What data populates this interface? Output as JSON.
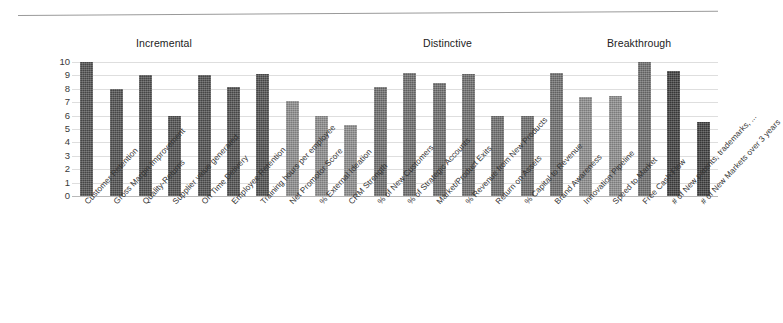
{
  "figure": {
    "top_rule": "horizontal-divider-rule"
  },
  "sections": [
    {
      "label": "Incremental"
    },
    {
      "label": "Distinctive"
    },
    {
      "label": "Breakthrough"
    }
  ],
  "chart_data": {
    "type": "bar",
    "title": "",
    "subtitle": "",
    "xlabel": "",
    "ylabel": "",
    "ylim": [
      0,
      10
    ],
    "grid": true,
    "legend": "none",
    "yticks": [
      10,
      9,
      8,
      7,
      6,
      5,
      4,
      3,
      2,
      1,
      0
    ],
    "section_groups": [
      "Incremental",
      "Distinctive",
      "Breakthrough"
    ],
    "categories": [
      "Customer Retention",
      "Gross Margin Improvement",
      "Quality-Returns",
      "Supplier value generated",
      "On Time Delivery",
      "Employee Retention",
      "Training hours per employee",
      "Net Promotor Score",
      "% External Ideation",
      "CRM Strength",
      "% of New Customers",
      "% of Strategic Accounts",
      "Market/Product Exits",
      "% Revenue from New Products",
      "Return on Assets",
      "% Capital to Revenue",
      "Brand Awareness",
      "Innovation Pipeline",
      "Speed to Market",
      "Free Cash Flow",
      "# of New patents, trademarks, ...",
      "# of New Markets over 3 years"
    ],
    "values": [
      10,
      8,
      9,
      6,
      9,
      8.1,
      9.1,
      7.1,
      6,
      5.3,
      8.1,
      9.2,
      8.4,
      9.1,
      6,
      6,
      9.2,
      7.4,
      7.5,
      10,
      9.3,
      5.5
    ],
    "values_trailing": [
      10
    ],
    "bar_tones": [
      "dark",
      "dark",
      "dark",
      "dark",
      "dark",
      "dark",
      "dark",
      "light",
      "light",
      "light",
      "mid",
      "mid",
      "mid",
      "mid",
      "mid",
      "mid",
      "mid",
      "light",
      "light",
      "mid",
      "darkest",
      "darkest"
    ]
  },
  "axis": {
    "y_min_label": "0",
    "y_max_label": "10"
  }
}
